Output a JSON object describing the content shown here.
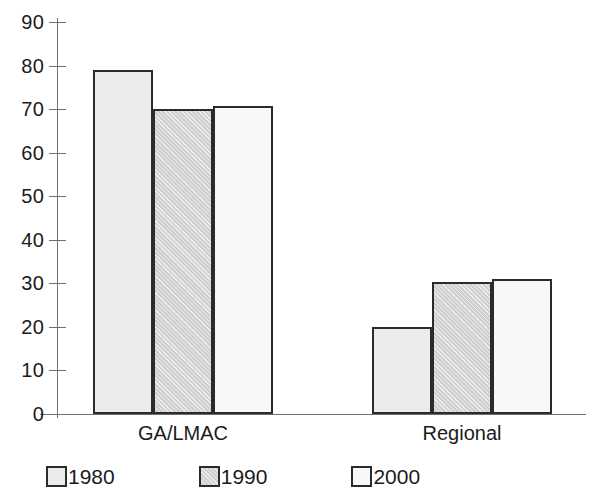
{
  "chart_data": {
    "type": "bar",
    "title": "",
    "subtitle": "",
    "xlabel": "",
    "ylabel": "",
    "categories": [
      "GA/LMAC",
      "Regional"
    ],
    "series": [
      {
        "name": "1980",
        "values": [
          79,
          20
        ],
        "color": "#ebebeb"
      },
      {
        "name": "1990",
        "values": [
          70,
          30.3
        ],
        "color": "#d7d7d7"
      },
      {
        "name": "2000",
        "values": [
          70.7,
          31
        ],
        "color": "#f8f8f8"
      }
    ],
    "ylim": [
      0,
      90
    ],
    "y_ticks": [
      0,
      10,
      20,
      30,
      40,
      50,
      60,
      70,
      80,
      90
    ],
    "y_tick_labels": [
      "0",
      "10",
      "20",
      "30",
      "40",
      "50",
      "60",
      "70",
      "80",
      "90"
    ],
    "grid": false,
    "legend_position": "bottom-left",
    "bar_border_color": "#2b2b2b",
    "axis_color": "#6f6f6f"
  },
  "axis": {
    "y_tick_labels": [
      "90",
      "80",
      "70",
      "60",
      "50",
      "40",
      "30",
      "20",
      "10",
      "0"
    ],
    "category_labels": [
      "GA/LMAC",
      "Regional"
    ]
  },
  "legend": {
    "items": [
      {
        "label": "1980",
        "swatch": "legend-swatch-1980"
      },
      {
        "label": "1990",
        "swatch": "legend-swatch-1990"
      },
      {
        "label": "2000",
        "swatch": "legend-swatch-2000"
      }
    ]
  }
}
